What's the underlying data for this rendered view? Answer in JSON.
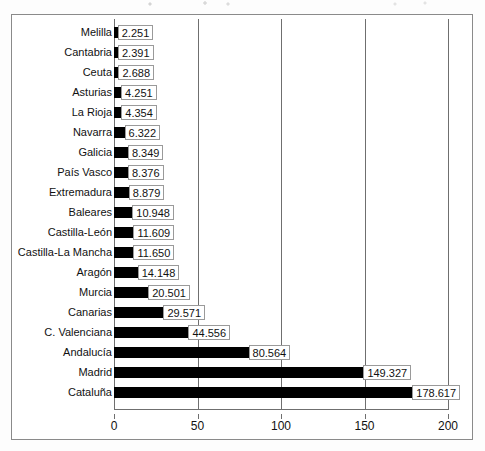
{
  "chart_data": {
    "type": "bar",
    "orientation": "horizontal",
    "title": "",
    "xlabel": "",
    "ylabel": "",
    "xlim": [
      0,
      200
    ],
    "xticks": [
      "0",
      "50",
      "100",
      "150",
      "200"
    ],
    "xtick_values": [
      0,
      50,
      100,
      150,
      200
    ],
    "grid": true,
    "legend": "none",
    "bar_color": "#000000",
    "categories": [
      "Melilla",
      "Cantabria",
      "Ceuta",
      "Asturias",
      "La Rioja",
      "Navarra",
      "Galicia",
      "País Vasco",
      "Extremadura",
      "Baleares",
      "Castilla-León",
      "Castilla-La Mancha",
      "Aragón",
      "Murcia",
      "Canarias",
      "C. Valenciana",
      "Andalucía",
      "Madrid",
      "Cataluña"
    ],
    "values": [
      2.251,
      2.391,
      2.688,
      4.251,
      4.354,
      6.322,
      8.349,
      8.376,
      8.879,
      10.948,
      11.609,
      11.65,
      14.148,
      20.501,
      29.571,
      44.556,
      80.564,
      149.327,
      178.617
    ],
    "value_labels": [
      "2.251",
      "2.391",
      "2.688",
      "4.251",
      "4.354",
      "6.322",
      "8.349",
      "8.376",
      "8.879",
      "10.948",
      "11.609",
      "11.650",
      "14.148",
      "20.501",
      "29.571",
      "44.556",
      "80.564",
      "149.327",
      "178.617"
    ]
  }
}
